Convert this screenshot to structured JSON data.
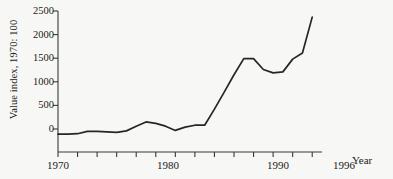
{
  "chart_data": {
    "type": "line",
    "title": "",
    "xlabel": "Year",
    "ylabel": "Value index, 1970: 100",
    "xlim": [
      1970,
      1997
    ],
    "ylim": [
      -250,
      2500
    ],
    "grid": false,
    "legend": null,
    "x_tick_labels": [
      "1970",
      "1980",
      "1990",
      "1996"
    ],
    "x_tick_values": [
      1970,
      1980,
      1990,
      1996
    ],
    "x_minor_ticks": [
      1972,
      1974,
      1976,
      1978,
      1982,
      1984,
      1986,
      1988,
      1992,
      1994
    ],
    "y_tick_labels": [
      "0",
      "500",
      "1000",
      "1500",
      "2000",
      "2500"
    ],
    "y_tick_values": [
      0,
      500,
      1000,
      1500,
      2000,
      2500
    ],
    "x": [
      1970,
      1971,
      1972,
      1973,
      1974,
      1975,
      1976,
      1977,
      1978,
      1979,
      1980,
      1981,
      1982,
      1983,
      1984,
      1985,
      1986,
      1987,
      1988,
      1989,
      1990,
      1991,
      1992,
      1993,
      1994,
      1995,
      1996
    ],
    "values": [
      -110,
      -110,
      -100,
      -50,
      -50,
      -60,
      -70,
      -40,
      60,
      150,
      120,
      60,
      -30,
      40,
      80,
      80,
      420,
      780,
      1150,
      1490,
      1490,
      1260,
      1190,
      1210,
      1480,
      1610,
      2370
    ],
    "series": [
      {
        "name": "Value index",
        "color": "#262626",
        "values": [
          -110,
          -110,
          -100,
          -50,
          -50,
          -60,
          -70,
          -40,
          60,
          150,
          120,
          60,
          -30,
          40,
          80,
          80,
          420,
          780,
          1150,
          1490,
          1490,
          1260,
          1190,
          1210,
          1480,
          1610,
          2370
        ]
      }
    ]
  },
  "axis": {
    "ylabel": "Value index, 1970: 100",
    "xlabel": "Year"
  },
  "colors": {
    "background": "#f7f7f5",
    "line": "#262626",
    "axis": "#3a3a3a",
    "text": "#1a1a1a"
  }
}
